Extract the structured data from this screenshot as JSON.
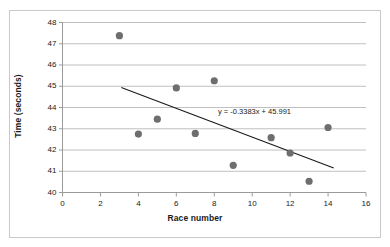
{
  "chart_data": {
    "type": "scatter",
    "title": "",
    "xlabel": "Race number",
    "ylabel": "Time (seconds)",
    "xlim": [
      0,
      16
    ],
    "ylim": [
      40,
      48
    ],
    "x_ticks": [
      0,
      2,
      4,
      6,
      8,
      10,
      12,
      14,
      16
    ],
    "y_ticks": [
      40,
      41,
      42,
      43,
      44,
      45,
      46,
      47,
      48
    ],
    "grid": "horizontal",
    "legend": "none",
    "marker_color": "#6e6e6e",
    "trendline_color": "#1a1a1a",
    "gridline_color": "#b0b0b0",
    "axis_color": "#9a9a9a",
    "points": [
      {
        "x": 3,
        "y": 47.38
      },
      {
        "x": 4,
        "y": 42.75
      },
      {
        "x": 5,
        "y": 43.45
      },
      {
        "x": 6,
        "y": 44.92
      },
      {
        "x": 7,
        "y": 42.78
      },
      {
        "x": 8,
        "y": 45.26
      },
      {
        "x": 9,
        "y": 41.28
      },
      {
        "x": 11,
        "y": 42.58
      },
      {
        "x": 12,
        "y": 41.86
      },
      {
        "x": 13,
        "y": 40.53
      },
      {
        "x": 14,
        "y": 43.06
      }
    ],
    "trendline": {
      "equation": "y = -0.3383x + 45.991",
      "slope": -0.3383,
      "intercept": 45.991,
      "x_start": 3.1,
      "x_end": 14.3
    },
    "annotations": [
      {
        "text": "y = -0.3383x + 45.991",
        "x": 10.1,
        "y": 44.2
      }
    ]
  }
}
